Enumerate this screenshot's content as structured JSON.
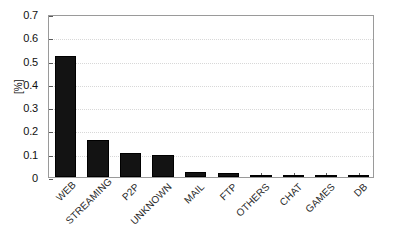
{
  "chart_data": {
    "type": "bar",
    "title": "",
    "subtitle": "",
    "xlabel": "",
    "ylabel": "[%]",
    "categories": [
      "WEB",
      "STREAMING",
      "P2P",
      "UNKNOWN",
      "MAIL",
      "FTP",
      "OTHERS",
      "CHAT",
      "GAMES",
      "DB"
    ],
    "values": [
      0.52,
      0.16,
      0.105,
      0.095,
      0.022,
      0.018,
      0.003,
      0.001,
      0.0005,
      0.0005
    ],
    "series": [
      {
        "name": "traffic share",
        "values": [
          0.52,
          0.16,
          0.105,
          0.095,
          0.022,
          0.018,
          0.003,
          0.001,
          0.0005,
          0.0005
        ]
      }
    ],
    "ylim": [
      0,
      0.7
    ],
    "yticks": [
      0,
      0.1,
      0.2,
      0.3,
      0.4,
      0.5,
      0.6,
      0.7
    ],
    "ytick_labels": [
      "0",
      "0.1",
      "0.2",
      "0.3",
      "0.4",
      "0.5",
      "0.6",
      "0.7"
    ],
    "grid": true,
    "grid_axis": "y",
    "legend": false,
    "legend_position": "none",
    "bar_color": "#131313",
    "axis_color": "#9a9a9a",
    "grid_color": "#d8d8d8",
    "xtick_label_rotation": -45,
    "annotations": []
  },
  "axis": {
    "y_label": "[%]"
  }
}
